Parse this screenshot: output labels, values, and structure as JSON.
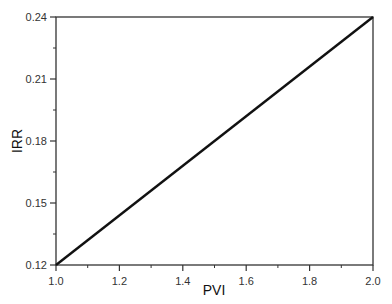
{
  "chart_data": {
    "type": "line",
    "title": "",
    "xlabel": "PVI",
    "ylabel": "IRR",
    "xlim": [
      1.0,
      2.0
    ],
    "ylim": [
      0.12,
      0.24
    ],
    "xticks": [
      "1.0",
      "1.2",
      "1.4",
      "1.6",
      "1.8",
      "2.0"
    ],
    "yticks": [
      "0.12",
      "0.15",
      "0.18",
      "0.21",
      "0.24"
    ],
    "grid": false,
    "legend": null,
    "series": [
      {
        "name": "IRR",
        "x": [
          1.0,
          2.0
        ],
        "y": [
          0.12,
          0.24
        ],
        "color": "#111111"
      }
    ]
  },
  "colors": {
    "line": "#111111",
    "axis": "#333333"
  }
}
